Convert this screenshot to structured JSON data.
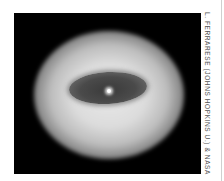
{
  "image": {
    "subject": "galaxy with dark central dust disk and bright nucleus",
    "background_color": "#000000"
  },
  "credit": {
    "text": "L. FERRARESE (JOHNS HOPKINS U.) & NASA"
  }
}
